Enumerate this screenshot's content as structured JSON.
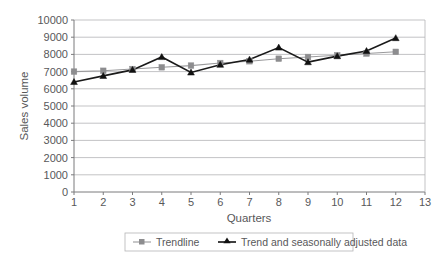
{
  "chart_data": {
    "type": "line",
    "title": "",
    "xlabel": "Quarters",
    "ylabel": "Sales volume",
    "x": [
      1,
      2,
      3,
      4,
      5,
      6,
      7,
      8,
      9,
      10,
      11,
      12
    ],
    "xlim": [
      1,
      13
    ],
    "ylim": [
      0,
      10000
    ],
    "xticks": [
      "1",
      "2",
      "3",
      "4",
      "5",
      "6",
      "7",
      "8",
      "9",
      "10",
      "11",
      "12",
      "13"
    ],
    "yticks": [
      "0",
      "1000",
      "2000",
      "3000",
      "4000",
      "5000",
      "6000",
      "7000",
      "8000",
      "9000",
      "10000"
    ],
    "grid": "horizontal",
    "legend_position": "bottom",
    "series": [
      {
        "name": "Trendline",
        "color": "#8d8d8f",
        "marker": "square",
        "values": [
          7000,
          7050,
          7150,
          7250,
          7350,
          7500,
          7600,
          7750,
          7850,
          7950,
          8050,
          8150
        ]
      },
      {
        "name": "Trend and seasonally adjusted data",
        "color": "#111111",
        "marker": "triangle",
        "values": [
          6400,
          6750,
          7100,
          7850,
          6950,
          7400,
          7700,
          8400,
          7550,
          7900,
          8200,
          8950
        ]
      }
    ]
  },
  "legend": {
    "items": [
      {
        "label": "Trendline"
      },
      {
        "label": "Trend and seasonally adjusted data"
      }
    ]
  },
  "axes": {
    "x_title": "Quarters",
    "y_title": "Sales volume"
  }
}
